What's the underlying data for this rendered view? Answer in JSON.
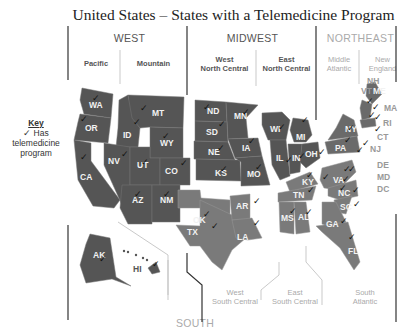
{
  "title": "United States – States with a Telemedicine Program",
  "key": {
    "title": "Key",
    "line1": "✓ Has",
    "line2": "telemedicine",
    "line3": "program"
  },
  "regions": {
    "west": "WEST",
    "midwest": "MIDWEST",
    "northeast": "NORTHEAST",
    "south": "SOUTH"
  },
  "divisions": {
    "pacific": "Pacific",
    "mountain": "Mountain",
    "west_north_central_1": "West",
    "west_north_central_2": "North Central",
    "east_north_central_1": "East",
    "east_north_central_2": "North Central",
    "middle_atlantic_1": "Middle",
    "middle_atlantic_2": "Atlantic",
    "new_england_1": "New",
    "new_england_2": "England",
    "west_south_central_1": "West",
    "west_south_central_2": "South Central",
    "east_south_central_1": "East",
    "east_south_central_2": "South Central",
    "south_atlantic_1": "South",
    "south_atlantic_2": "Atlantic"
  },
  "colors": {
    "west_midwest_fill": "#555555",
    "south_fill": "#7a7a7a",
    "northeast_fill": "#6a6a6a",
    "divider_dark": "#333333",
    "divider_light": "#bbbbbb",
    "check": "#111111"
  },
  "states": {
    "WA": {
      "label": "WA",
      "region": "West",
      "division": "Pacific",
      "telemedicine": true
    },
    "OR": {
      "label": "OR",
      "region": "West",
      "division": "Pacific",
      "telemedicine": true
    },
    "CA": {
      "label": "CA",
      "region": "West",
      "division": "Pacific",
      "telemedicine": true
    },
    "AK": {
      "label": "AK",
      "region": "West",
      "division": "Pacific",
      "telemedicine": true
    },
    "HI": {
      "label": "HI",
      "region": "West",
      "division": "Pacific",
      "telemedicine": true
    },
    "MT": {
      "label": "MT",
      "region": "West",
      "division": "Mountain",
      "telemedicine": true
    },
    "ID": {
      "label": "ID",
      "region": "West",
      "division": "Mountain",
      "telemedicine": true
    },
    "WY": {
      "label": "WY",
      "region": "West",
      "division": "Mountain",
      "telemedicine": true
    },
    "NV": {
      "label": "NV",
      "region": "West",
      "division": "Mountain",
      "telemedicine": true
    },
    "UT": {
      "label": "UT",
      "region": "West",
      "division": "Mountain",
      "telemedicine": true
    },
    "CO": {
      "label": "CO",
      "region": "West",
      "division": "Mountain",
      "telemedicine": true
    },
    "AZ": {
      "label": "AZ",
      "region": "West",
      "division": "Mountain",
      "telemedicine": true
    },
    "NM": {
      "label": "NM",
      "region": "West",
      "division": "Mountain",
      "telemedicine": true
    },
    "ND": {
      "label": "ND",
      "region": "Midwest",
      "division": "West North Central",
      "telemedicine": true
    },
    "SD": {
      "label": "SD",
      "region": "Midwest",
      "division": "West North Central",
      "telemedicine": true
    },
    "NE": {
      "label": "NE",
      "region": "Midwest",
      "division": "West North Central",
      "telemedicine": true
    },
    "KS": {
      "label": "KS",
      "region": "Midwest",
      "division": "West North Central",
      "telemedicine": true
    },
    "MN": {
      "label": "MN",
      "region": "Midwest",
      "division": "West North Central",
      "telemedicine": true
    },
    "IA": {
      "label": "IA",
      "region": "Midwest",
      "division": "West North Central",
      "telemedicine": true
    },
    "MO": {
      "label": "MO",
      "region": "Midwest",
      "division": "West North Central",
      "telemedicine": true
    },
    "WI": {
      "label": "WI",
      "region": "Midwest",
      "division": "East North Central",
      "telemedicine": true
    },
    "MI": {
      "label": "MI",
      "region": "Midwest",
      "division": "East North Central",
      "telemedicine": true
    },
    "IL": {
      "label": "IL",
      "region": "Midwest",
      "division": "East North Central",
      "telemedicine": true
    },
    "IN": {
      "label": "IN",
      "region": "Midwest",
      "division": "East North Central",
      "telemedicine": true
    },
    "OH": {
      "label": "OH",
      "region": "Midwest",
      "division": "East North Central",
      "telemedicine": true
    },
    "NY": {
      "label": "NY",
      "region": "Northeast",
      "division": "Middle Atlantic",
      "telemedicine": true
    },
    "PA": {
      "label": "PA",
      "region": "Northeast",
      "division": "Middle Atlantic",
      "telemedicine": true
    },
    "NJ": {
      "label": "NJ",
      "region": "Northeast",
      "division": "Middle Atlantic",
      "telemedicine": true
    },
    "NH": {
      "label": "NH",
      "region": "Northeast",
      "division": "New England",
      "telemedicine": true
    },
    "VT": {
      "label": "VT",
      "region": "Northeast",
      "division": "New England",
      "telemedicine": true
    },
    "ME": {
      "label": "ME",
      "region": "Northeast",
      "division": "New England",
      "telemedicine": true
    },
    "MA": {
      "label": "MA",
      "region": "Northeast",
      "division": "New England",
      "telemedicine": true
    },
    "RI": {
      "label": "RI",
      "region": "Northeast",
      "division": "New England",
      "telemedicine": true
    },
    "CT": {
      "label": "CT",
      "region": "Northeast",
      "division": "New England",
      "telemedicine": true
    },
    "OK": {
      "label": "OK",
      "region": "South",
      "division": "West South Central",
      "telemedicine": true
    },
    "TX": {
      "label": "TX",
      "region": "South",
      "division": "West South Central",
      "telemedicine": true
    },
    "AR": {
      "label": "AR",
      "region": "South",
      "division": "West South Central",
      "telemedicine": true
    },
    "LA": {
      "label": "LA",
      "region": "South",
      "division": "West South Central",
      "telemedicine": true
    },
    "KY": {
      "label": "KY",
      "region": "South",
      "division": "East South Central",
      "telemedicine": true
    },
    "TN": {
      "label": "TN",
      "region": "South",
      "division": "East South Central",
      "telemedicine": true
    },
    "MS": {
      "label": "MS",
      "region": "South",
      "division": "East South Central",
      "telemedicine": true
    },
    "AL": {
      "label": "AL",
      "region": "South",
      "division": "East South Central",
      "telemedicine": true
    },
    "WV": {
      "label": "WV",
      "region": "South",
      "division": "South Atlantic",
      "telemedicine": true
    },
    "VA": {
      "label": "VA",
      "region": "South",
      "division": "South Atlantic",
      "telemedicine": true
    },
    "NC": {
      "label": "NC",
      "region": "South",
      "division": "South Atlantic",
      "telemedicine": true
    },
    "SC": {
      "label": "SC",
      "region": "South",
      "division": "South Atlantic",
      "telemedicine": true
    },
    "GA": {
      "label": "GA",
      "region": "South",
      "division": "South Atlantic",
      "telemedicine": true
    },
    "FL": {
      "label": "FL",
      "region": "South",
      "division": "South Atlantic",
      "telemedicine": true
    },
    "DE": {
      "label": "DE",
      "region": "South",
      "division": "South Atlantic",
      "telemedicine": true
    },
    "MD": {
      "label": "MD",
      "region": "South",
      "division": "South Atlantic",
      "telemedicine": true
    },
    "DC": {
      "label": "DC",
      "region": "South",
      "division": "South Atlantic",
      "telemedicine": true
    }
  },
  "check_glyph": "✓"
}
